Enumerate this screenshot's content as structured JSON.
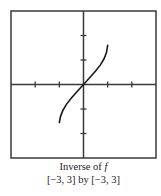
{
  "chart_data": {
    "type": "line",
    "title": "Inverse of f",
    "title_function": "f",
    "title_prefix": "Inverse of ",
    "window_text": "[−3, 3] by [−3, 3]",
    "xlim": [
      -3,
      3
    ],
    "ylim": [
      -3,
      3
    ],
    "xticks": [
      -2,
      -1,
      1,
      2
    ],
    "yticks": [
      -2,
      -1,
      1,
      2
    ],
    "tick_labels_shown": false,
    "grid": false,
    "legend": "none",
    "series": [
      {
        "name": "inverse of f",
        "x": [
          -1.0,
          -0.95,
          -0.85,
          -0.7,
          -0.5,
          -0.3,
          -0.15,
          0,
          0.15,
          0.3,
          0.5,
          0.7,
          0.85,
          0.95,
          1.0
        ],
        "y": [
          -1.55,
          -1.3,
          -1.05,
          -0.8,
          -0.55,
          -0.33,
          -0.16,
          0,
          0.16,
          0.33,
          0.55,
          0.8,
          1.05,
          1.3,
          1.6
        ]
      }
    ],
    "colors": {
      "frame": "#3a3a3a",
      "axes": "#3a3a3a",
      "curve": "#1a1a1a"
    }
  }
}
